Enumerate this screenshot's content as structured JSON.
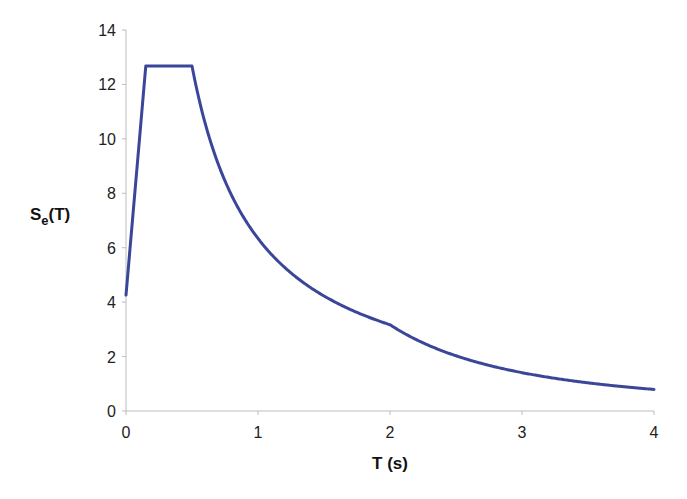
{
  "chart_data": {
    "type": "line",
    "title": "",
    "xlabel": "T (s)",
    "ylabel_main": "S",
    "ylabel_sub": "e",
    "ylabel_tail": "(T)",
    "ylabel": "Se(T)",
    "xlim": [
      0,
      4
    ],
    "ylim": [
      0,
      14
    ],
    "xticks": [
      0,
      1,
      2,
      3,
      4
    ],
    "yticks": [
      0,
      2,
      4,
      6,
      8,
      10,
      12,
      14
    ],
    "grid": false,
    "legend": null,
    "line_color": "#3a4699",
    "series": [
      {
        "name": "Se(T)",
        "x": [
          0,
          0.15,
          0.5,
          0.6,
          0.75,
          1.0,
          1.25,
          1.5,
          1.75,
          2.0,
          2.25,
          2.5,
          2.75,
          3.0,
          3.25,
          3.5,
          3.75,
          4.0
        ],
        "values": [
          4.26,
          12.68,
          12.68,
          10.57,
          8.45,
          6.34,
          5.07,
          4.23,
          3.62,
          3.17,
          2.5,
          2.03,
          1.68,
          1.41,
          1.2,
          1.03,
          0.9,
          0.79
        ]
      }
    ]
  }
}
